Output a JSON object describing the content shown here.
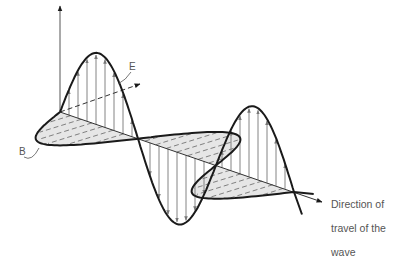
{
  "labels": {
    "electric_field": "E",
    "magnetic_field": "B",
    "direction_line1": "Direction of",
    "direction_line2": "travel of the",
    "direction_line3": "wave"
  },
  "colors": {
    "line": "#1a1a1a",
    "field_vector": "#777777",
    "b_plane_fill": "#e6e6e6",
    "text": "#555555"
  },
  "wave": {
    "cycles_shown": 1.5,
    "e_field_orientation": "vertical",
    "b_field_orientation": "horizontal",
    "b_hatched": true
  }
}
